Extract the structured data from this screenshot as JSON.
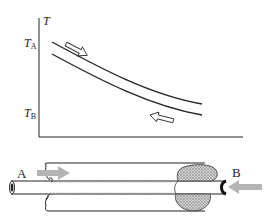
{
  "figure": {
    "type": "counter-current heat exchanger diagram",
    "graph": {
      "y_axis_label": "T",
      "tick_label_top": {
        "main": "T",
        "sub": "A"
      },
      "tick_label_bottom": {
        "main": "T",
        "sub": "B"
      },
      "upper_curve": "hot stream temperature profile (flow left to right)",
      "lower_curve": "cold stream temperature profile (flow right to left)",
      "arrow_upper_direction": "right-down",
      "arrow_lower_direction": "left-up"
    },
    "exchanger": {
      "inlet_left_label": "A",
      "inlet_right_label": "B",
      "arrow_color": "#b5b5b5",
      "line_color": "#222222"
    }
  }
}
